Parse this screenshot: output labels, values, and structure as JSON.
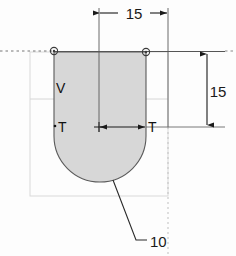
{
  "drawing": {
    "title": "Technical sketch of U-shaped profile with dimensions",
    "background_color": "#fdfdfd",
    "shape_fill": "#d5d5d5",
    "shape_stroke": "#4a4a4a",
    "guide_color": "#cfcfcf",
    "dim_color": "#1a1a1a"
  },
  "dimensions": {
    "width_label": "15",
    "height_label": "15",
    "leader_label": "10"
  },
  "labels": {
    "vertex_v": "V",
    "tangent_left": "T",
    "tangent_right": "T"
  },
  "geometry": {
    "shape_left_x": 54,
    "shape_right_x": 146,
    "shape_top_y": 52,
    "shape_straight_bottom_y": 127,
    "shape_arc_bottom_y": 182,
    "guide_rect": {
      "x": 30,
      "y": 52,
      "width": 138,
      "height": 144
    },
    "guide_hline_y": 99,
    "centerline_y": 51,
    "top_dim_y": 13,
    "top_dim_x1": 99,
    "top_dim_x2": 168,
    "mid_dim_y": 127,
    "mid_dim_x1": 99,
    "mid_dim_x2": 146,
    "right_dim_x": 225,
    "right_dim_y1": 52,
    "right_dim_y2": 127,
    "marker_left": {
      "cx": 54,
      "cy": 51
    },
    "marker_right": {
      "cx": 146,
      "cy": 52
    },
    "leader_from": {
      "x": 113,
      "y": 180
    },
    "leader_to": {
      "x": 136,
      "y": 240
    },
    "leader_tick_end": {
      "x": 146,
      "y": 240
    }
  }
}
